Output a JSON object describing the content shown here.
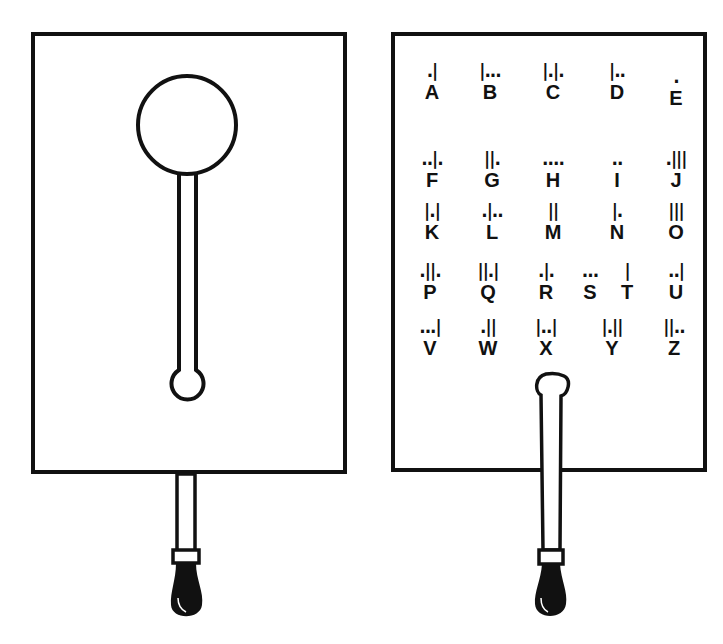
{
  "colors": {
    "ink": "#111111",
    "paper": "#ffffff"
  },
  "left_card": {
    "description": "Blank card with circular window cut-out and slot",
    "window_shape": "circle",
    "handle_shape": "rod-with-grip"
  },
  "right_card": {
    "description": "Card printed with Morse alphabet, pointer slid under letter X",
    "alphabet": [
      {
        "letter": "A",
        "code": ".|"
      },
      {
        "letter": "B",
        "code": "|..."
      },
      {
        "letter": "C",
        "code": "|.|."
      },
      {
        "letter": "D",
        "code": "|.."
      },
      {
        "letter": "E",
        "code": "."
      },
      {
        "letter": "F",
        "code": "..|."
      },
      {
        "letter": "G",
        "code": "||."
      },
      {
        "letter": "H",
        "code": "...."
      },
      {
        "letter": "I",
        "code": ".."
      },
      {
        "letter": "J",
        "code": ".|||"
      },
      {
        "letter": "K",
        "code": "|.|"
      },
      {
        "letter": "L",
        "code": ".|.."
      },
      {
        "letter": "M",
        "code": "||"
      },
      {
        "letter": "N",
        "code": "|."
      },
      {
        "letter": "O",
        "code": "|||"
      },
      {
        "letter": "P",
        "code": ".||."
      },
      {
        "letter": "Q",
        "code": "||.|"
      },
      {
        "letter": "R",
        "code": ".|."
      },
      {
        "letter": "S",
        "code": "..."
      },
      {
        "letter": "T",
        "code": "|"
      },
      {
        "letter": "U",
        "code": "..|"
      },
      {
        "letter": "V",
        "code": "...|"
      },
      {
        "letter": "W",
        "code": ".||"
      },
      {
        "letter": "X",
        "code": "|..|"
      },
      {
        "letter": "Y",
        "code": "|.||"
      },
      {
        "letter": "Z",
        "code": "||.."
      }
    ],
    "pointer_at": "X"
  }
}
